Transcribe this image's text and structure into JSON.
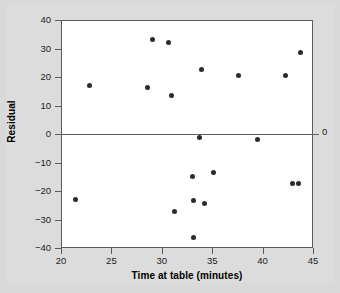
{
  "chart_data": {
    "type": "scatter",
    "title": "",
    "xlabel": "Time at table (minutes)",
    "ylabel": "Residual",
    "xlim": [
      20,
      45
    ],
    "ylim": [
      -40,
      40
    ],
    "xticks": [
      20,
      25,
      30,
      35,
      40,
      45
    ],
    "yticks": [
      40,
      30,
      20,
      10,
      0,
      -10,
      -20,
      -30,
      -40
    ],
    "grid": false,
    "legend": null,
    "reference_line": {
      "y": 0,
      "label": "0"
    },
    "series": [
      {
        "name": "Residuals",
        "marker": "circle",
        "color": "#2b2b2b",
        "points": [
          {
            "x": 21.3,
            "y": -22.8
          },
          {
            "x": 22.7,
            "y": 17.5
          },
          {
            "x": 28.5,
            "y": 16.5
          },
          {
            "x": 29.0,
            "y": 33.5
          },
          {
            "x": 30.6,
            "y": 32.5
          },
          {
            "x": 30.9,
            "y": 13.9
          },
          {
            "x": 31.2,
            "y": -26.7
          },
          {
            "x": 32.9,
            "y": -14.6
          },
          {
            "x": 33.0,
            "y": -23.0
          },
          {
            "x": 33.0,
            "y": -36.0
          },
          {
            "x": 33.6,
            "y": -1.0
          },
          {
            "x": 33.8,
            "y": 23.0
          },
          {
            "x": 34.1,
            "y": -24.2
          },
          {
            "x": 35.0,
            "y": -13.2
          },
          {
            "x": 37.5,
            "y": 21.0
          },
          {
            "x": 39.4,
            "y": -1.5
          },
          {
            "x": 42.2,
            "y": 20.8
          },
          {
            "x": 42.9,
            "y": -17.0
          },
          {
            "x": 43.5,
            "y": -17.1
          },
          {
            "x": 43.7,
            "y": 28.8
          }
        ]
      }
    ]
  },
  "colors": {
    "background": "#d9d9d9",
    "plot_background": "#ffffff",
    "axis": "#5a5a5a",
    "marker": "#2b2b2b",
    "text": "#1d1d1d"
  }
}
